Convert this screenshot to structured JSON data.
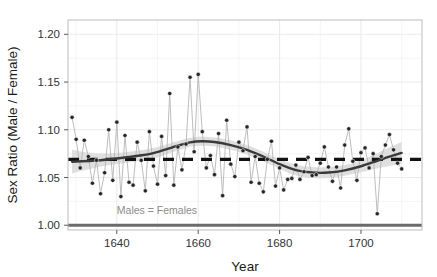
{
  "chart_data": {
    "type": "line",
    "title": "",
    "xlabel": "Year",
    "ylabel": "Sex Ratio (Male / Female)",
    "xlim": [
      1628,
      1715
    ],
    "ylim": [
      0.995,
      1.215
    ],
    "xticks": [
      1640,
      1660,
      1680,
      1700
    ],
    "xtick_labels": [
      "1640",
      "1660",
      "1680",
      "1700"
    ],
    "yticks": [
      1.0,
      1.05,
      1.1,
      1.15,
      1.2
    ],
    "ytick_labels": [
      "1.00",
      "1.05",
      "1.10",
      "1.15",
      "1.20"
    ],
    "grid": true,
    "legend": "none",
    "annotations": [
      {
        "text": "Males = Females",
        "x": 1640,
        "y": 1.012,
        "color": "#8c8c8c"
      }
    ],
    "reference_lines": [
      {
        "name": "equality-line",
        "y": 1.0,
        "style": "solid",
        "color": "#6b6b6b",
        "width": 3
      },
      {
        "name": "mean-line",
        "y": 1.069,
        "style": "dashed",
        "color": "#111111",
        "width": 3
      }
    ],
    "series": [
      {
        "name": "Annual sex ratio of baptisms",
        "style": "points-with-connecting-line",
        "point_color": "#262626",
        "line_color": "#b0b0b0",
        "x": [
          1629,
          1630,
          1631,
          1632,
          1633,
          1634,
          1635,
          1636,
          1637,
          1638,
          1639,
          1640,
          1641,
          1642,
          1643,
          1644,
          1645,
          1646,
          1647,
          1648,
          1649,
          1650,
          1651,
          1652,
          1653,
          1654,
          1655,
          1656,
          1657,
          1658,
          1659,
          1660,
          1661,
          1662,
          1663,
          1664,
          1665,
          1666,
          1667,
          1668,
          1669,
          1670,
          1671,
          1672,
          1673,
          1674,
          1675,
          1676,
          1677,
          1678,
          1679,
          1680,
          1681,
          1682,
          1683,
          1684,
          1685,
          1686,
          1687,
          1688,
          1689,
          1690,
          1691,
          1692,
          1693,
          1694,
          1695,
          1696,
          1697,
          1698,
          1699,
          1700,
          1701,
          1702,
          1703,
          1704,
          1705,
          1706,
          1707,
          1708,
          1709,
          1710
        ],
        "y": [
          1.113,
          1.09,
          1.06,
          1.089,
          1.072,
          1.044,
          1.068,
          1.033,
          1.055,
          1.1,
          1.047,
          1.108,
          1.03,
          1.094,
          1.045,
          1.042,
          1.087,
          1.068,
          1.036,
          1.098,
          1.062,
          1.043,
          1.093,
          1.052,
          1.138,
          1.042,
          1.082,
          1.058,
          1.085,
          1.155,
          1.077,
          1.158,
          1.098,
          1.06,
          1.073,
          1.053,
          1.096,
          1.031,
          1.11,
          1.064,
          1.051,
          1.087,
          1.078,
          1.103,
          1.045,
          1.072,
          1.044,
          1.035,
          1.069,
          1.088,
          1.041,
          1.06,
          1.037,
          1.048,
          1.049,
          1.063,
          1.048,
          1.056,
          1.071,
          1.052,
          1.053,
          1.065,
          1.082,
          1.061,
          1.046,
          1.061,
          1.039,
          1.084,
          1.101,
          1.067,
          1.047,
          1.076,
          1.081,
          1.06,
          1.075,
          1.012,
          1.072,
          1.084,
          1.095,
          1.079,
          1.065,
          1.059
        ]
      },
      {
        "name": "LOESS smooth trend",
        "style": "smooth-line",
        "color": "#3a3a3a",
        "x": [
          1629,
          1634,
          1639,
          1644,
          1649,
          1654,
          1658,
          1661,
          1664,
          1668,
          1672,
          1676,
          1680,
          1684,
          1688,
          1692,
          1696,
          1700,
          1704,
          1707,
          1710
        ],
        "y": [
          1.0665,
          1.0675,
          1.0695,
          1.072,
          1.0755,
          1.082,
          1.0868,
          1.088,
          1.0872,
          1.084,
          1.079,
          1.072,
          1.064,
          1.0578,
          1.0552,
          1.0552,
          1.0575,
          1.0618,
          1.0675,
          1.0718,
          1.0758
        ]
      },
      {
        "name": "Confidence band",
        "style": "ribbon",
        "color": "#d6d6d6",
        "x": [
          1629,
          1634,
          1639,
          1644,
          1649,
          1654,
          1658,
          1661,
          1664,
          1668,
          1672,
          1676,
          1680,
          1684,
          1688,
          1692,
          1696,
          1700,
          1704,
          1707,
          1710
        ],
        "ymin": [
          1.0545,
          1.0595,
          1.0635,
          1.0665,
          1.07,
          1.077,
          1.0822,
          1.0833,
          1.0825,
          1.079,
          1.074,
          1.067,
          1.059,
          1.0522,
          1.0495,
          1.0495,
          1.0518,
          1.0555,
          1.0595,
          1.062,
          1.0645
        ],
        "ymax": [
          1.079,
          1.0755,
          1.0755,
          1.0775,
          1.081,
          1.087,
          1.0914,
          1.0927,
          1.0919,
          1.089,
          1.084,
          1.077,
          1.069,
          1.0634,
          1.0609,
          1.0609,
          1.0632,
          1.0681,
          1.0755,
          1.0816,
          1.0871
        ]
      }
    ]
  },
  "axes": {
    "x_title": "Year",
    "y_title": "Sex Ratio (Male / Female)"
  }
}
